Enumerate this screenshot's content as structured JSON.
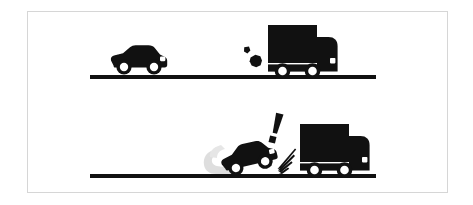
{
  "illustration": {
    "title": "Truck dropping debris causes following car to crash",
    "background_color": "#ffffff",
    "border_color": "#d6d6d6",
    "ink_color": "#111111",
    "highlight_color": "#ffffff",
    "trail_color": "#d9d9d9",
    "frame": {
      "x": 27,
      "y": 11,
      "width": 421,
      "height": 182
    }
  },
  "panels": [
    {
      "id": "panel-top",
      "name": "before-impact",
      "caption": "",
      "road": {
        "x1": 90,
        "x2": 376,
        "y": 77,
        "thickness": 4,
        "color": "#111111"
      },
      "objects": [
        {
          "type": "car",
          "name": "following-car",
          "label": "car",
          "x": 108,
          "y": 44,
          "width": 60,
          "height": 32,
          "rotation": 0,
          "facing": "right",
          "has_trail": false
        },
        {
          "type": "debris",
          "name": "falling-debris",
          "label": "debris",
          "pieces": [
            {
              "cx": 247,
              "cy": 50,
              "r": 3.2
            },
            {
              "cx": 256,
              "cy": 61,
              "r": 6.0
            }
          ]
        },
        {
          "type": "truck",
          "name": "lead-truck",
          "label": "truck",
          "x": 265,
          "y": 23,
          "width": 75,
          "height": 54,
          "rotation": 0,
          "facing": "right"
        }
      ]
    },
    {
      "id": "panel-bottom",
      "name": "after-impact",
      "caption": "",
      "road": {
        "x1": 90,
        "x2": 376,
        "y": 176,
        "thickness": 4,
        "color": "#111111"
      },
      "objects": [
        {
          "type": "car",
          "name": "crashing-car",
          "label": "car",
          "x": 218,
          "y": 142,
          "width": 60,
          "height": 32,
          "rotation": -13,
          "facing": "right",
          "has_trail": true
        },
        {
          "type": "exclamation",
          "name": "alert-exclamation-icon",
          "label": "!",
          "x": 269,
          "y": 113,
          "height": 30,
          "rotation": 14
        },
        {
          "type": "impact",
          "name": "impact-lines",
          "label": "impact",
          "x": 277,
          "y": 160,
          "ray_count": 4
        },
        {
          "type": "truck",
          "name": "lead-truck",
          "label": "truck",
          "x": 297,
          "y": 122,
          "width": 75,
          "height": 54,
          "rotation": 0,
          "facing": "right"
        }
      ]
    }
  ]
}
